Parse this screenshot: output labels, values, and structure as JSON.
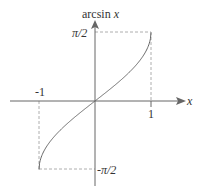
{
  "diagram": {
    "y_axis_label": "arcsin x",
    "y_axis_label_func": "arcsin",
    "y_axis_label_var": "x",
    "x_axis_label": "x",
    "x_ticks": [
      {
        "label": "-1",
        "value": -1
      },
      {
        "label": "1",
        "value": 1
      }
    ],
    "y_ticks": [
      {
        "label": "π/2",
        "value": 1.5708
      },
      {
        "label": "-π/2",
        "value": -1.5708
      }
    ],
    "curve": "y = arcsin(x), x in [-1, 1]",
    "colors": {
      "axes": "#555555",
      "curve": "#555555",
      "guides": "#888888"
    }
  }
}
